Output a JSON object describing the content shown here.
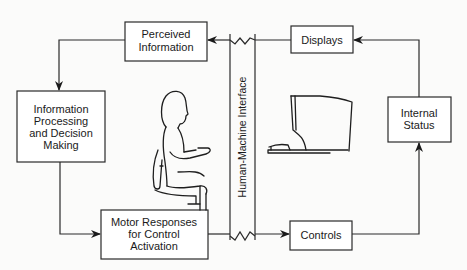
{
  "diagram": {
    "nodes": {
      "perceived": {
        "lines": [
          "Perceived",
          "Information"
        ]
      },
      "processing": {
        "lines": [
          "Information",
          "Processing",
          "and Decision",
          "Making"
        ]
      },
      "motor": {
        "lines": [
          "Motor Responses",
          "for Control",
          "Activation"
        ]
      },
      "displays": {
        "lines": [
          "Displays"
        ]
      },
      "controls": {
        "lines": [
          "Controls"
        ]
      },
      "internal": {
        "lines": [
          "Internal",
          "Status"
        ]
      }
    },
    "interface_label": "Human-Machine Interface",
    "illustrations": [
      "seated-person",
      "computer-workstation"
    ],
    "edges": [
      {
        "from": "displays",
        "to": "perceived"
      },
      {
        "from": "perceived",
        "to": "processing"
      },
      {
        "from": "processing",
        "to": "motor"
      },
      {
        "from": "motor",
        "to": "controls"
      },
      {
        "from": "controls",
        "to": "internal"
      },
      {
        "from": "internal",
        "to": "displays"
      }
    ],
    "colors": {
      "stroke": "#2a2a2a",
      "text": "#1a1a1a",
      "background": "#fbfbfa"
    }
  }
}
